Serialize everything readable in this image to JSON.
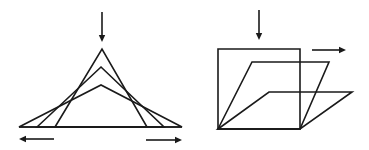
{
  "figure": {
    "panels": [
      {
        "id": "left",
        "description": "Three nested triangles sharing a base line, with decreasing apex heights; downward force on apex spreads the base outward",
        "force_arrows": [
          {
            "direction": "down",
            "x1": 102,
            "y1": 12,
            "x2": 102,
            "y2": 42
          },
          {
            "direction": "left",
            "x1": 54,
            "y1": 139,
            "x2": 19,
            "y2": 139
          },
          {
            "direction": "right",
            "x1": 146,
            "y1": 140,
            "x2": 182,
            "y2": 140
          }
        ],
        "base_line": {
          "x1": 19,
          "y1": 127,
          "x2": 182,
          "y2": 127
        },
        "shapes": [
          {
            "type": "triangle",
            "points": "55,127 102,49 147,127"
          },
          {
            "type": "triangle",
            "points": "37,127 101,67 164,127"
          },
          {
            "type": "triangle",
            "points": "19,127 101,85 182,127"
          }
        ]
      },
      {
        "id": "right",
        "description": "Square shearing into progressively flatter parallelograms under downward force, top edge displaced to the right",
        "force_arrows": [
          {
            "direction": "down",
            "x1": 259,
            "y1": 10,
            "x2": 259,
            "y2": 40
          },
          {
            "direction": "right",
            "x1": 312,
            "y1": 50,
            "x2": 346,
            "y2": 50
          }
        ],
        "shapes": [
          {
            "type": "square",
            "points": "218,49 300,49 300,129 218,129"
          },
          {
            "type": "parallelogram",
            "points": "218,129 252,62 329,62 300,129"
          },
          {
            "type": "parallelogram",
            "points": "218,129 269,92 352,92 300,129"
          }
        ]
      }
    ],
    "colors": {
      "stroke": "#1a1a1a",
      "background": "#ffffff"
    }
  }
}
